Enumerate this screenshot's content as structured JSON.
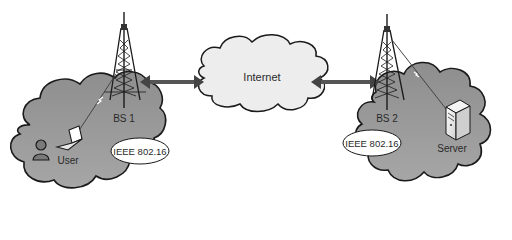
{
  "diagram": {
    "nodes": {
      "internet": {
        "label": "Internet"
      },
      "bs1": {
        "label": "BS 1"
      },
      "bs2": {
        "label": "BS 2"
      },
      "user": {
        "label": "User"
      },
      "server": {
        "label": "Server"
      },
      "std1": {
        "label": "IEEE 802.16"
      },
      "std2": {
        "label": "IEEE 802.16"
      }
    },
    "edges": [
      {
        "from": "bs1",
        "to": "internet",
        "type": "bidirectional-arrow"
      },
      {
        "from": "internet",
        "to": "bs2",
        "type": "bidirectional-arrow"
      },
      {
        "from": "user",
        "to": "bs1",
        "type": "wireless-link"
      },
      {
        "from": "server",
        "to": "bs2",
        "type": "wireless-link"
      }
    ],
    "colors": {
      "cloud_fill": "#9a9a9a",
      "internet_fill": "#ededed",
      "outline": "#1a1a1a",
      "arrow": "#555555"
    }
  }
}
